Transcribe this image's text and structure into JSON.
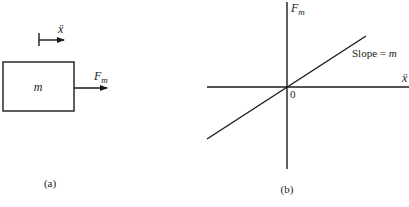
{
  "figure": {
    "panel_a": {
      "caption": "(a)",
      "mass_label": "m",
      "force_label": "F",
      "force_subscript": "m",
      "acceleration_label": "ẍ"
    },
    "panel_b": {
      "caption": "(b)",
      "y_axis_label": "F",
      "y_axis_subscript": "m",
      "x_axis_label": "ẍ",
      "origin_label": "0",
      "slope_text": "Slope = ",
      "slope_symbol": "m"
    }
  },
  "colors": {
    "ink": "#1a1a1a",
    "background": "#ffffff"
  }
}
